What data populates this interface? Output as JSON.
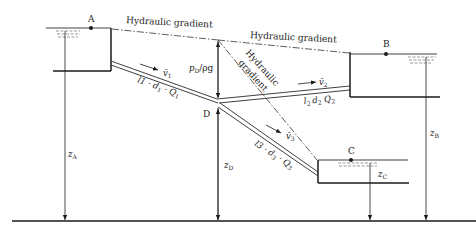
{
  "diagram": {
    "type": "branching pipe system (three reservoirs)",
    "reservoirs": [
      {
        "id": "A",
        "label": "A"
      },
      {
        "id": "B",
        "label": "B"
      },
      {
        "id": "C",
        "label": "C"
      }
    ],
    "junction": {
      "id": "D",
      "label": "D"
    },
    "hydraulic_gradient_labels": {
      "ad": "Hydraulic gradient",
      "db": "Hydraulic gradient",
      "dc_line1": "Hydraulic",
      "dc_line2": "gradient"
    },
    "pipes": [
      {
        "id": "1",
        "velocity": "v̄",
        "velocity_sub": "1",
        "spec": "l",
        "spec_text": "1 · d",
        "spec_d_sub": "1",
        "spec_q": " · Q",
        "spec_q_sub": "1"
      },
      {
        "id": "2",
        "velocity": "v̄",
        "velocity_sub": "2",
        "spec": "l",
        "spec_text": "2 ",
        "spec_d": "d",
        "spec_d_sub": "2",
        "spec_q": " Q",
        "spec_q_sub": "2"
      },
      {
        "id": "3",
        "velocity": "v̄",
        "velocity_sub": "3",
        "spec": "l",
        "spec_text": "3 · d",
        "spec_d_sub": "3",
        "spec_q": " · Q",
        "spec_q_sub": "3"
      }
    ],
    "pressure_head": {
      "p": "p",
      "sub": "D",
      "rest": "/ρg"
    },
    "elevations": [
      {
        "id": "zA",
        "z": "z",
        "sub": "A"
      },
      {
        "id": "zB",
        "z": "z",
        "sub": "B"
      },
      {
        "id": "zC",
        "z": "z",
        "sub": "C"
      },
      {
        "id": "zD",
        "z": "z",
        "sub": "D"
      }
    ]
  }
}
